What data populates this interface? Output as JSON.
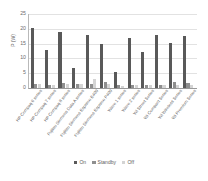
{
  "chart_data": {
    "type": "bar",
    "title": "",
    "xlabel": "",
    "ylabel": "P (W)",
    "ylim": [
      0,
      25
    ],
    "yticks": [
      0,
      5,
      10,
      15,
      20,
      25
    ],
    "grid": true,
    "legend_position": "bottom-center",
    "categories": [
      "HP Compaq 6 series",
      "HP Compaq 7 series",
      "HP Compaq 8 series",
      "Fujitsu Siemens Data A series",
      "Fujitsu Siemens Esprimo E400",
      "Fujitsu Siemens Esprimo P400",
      "Wave 1 series",
      "Wave 2 series",
      "Wi Street Series",
      "Wi Compact Series",
      "Wi Wireless Series",
      "Wi Premium Series"
    ],
    "series": [
      {
        "name": "On",
        "color": "#595959",
        "values": [
          20.2,
          12.8,
          18.8,
          6.8,
          17.8,
          14.8,
          5.4,
          16.9,
          12.3,
          17.9,
          15.2,
          17.6
        ]
      },
      {
        "name": "Standby",
        "color": "#8f8f8f",
        "values": [
          1.5,
          1.1,
          1.6,
          1.5,
          1.4,
          1.9,
          0.9,
          1.0,
          1.1,
          1.0,
          2.0,
          1.7
        ]
      },
      {
        "name": "Off",
        "color": "#d4d4d4",
        "values": [
          1.4,
          1.0,
          1.5,
          1.3,
          3.1,
          1.2,
          0.8,
          0.9,
          1.0,
          0.9,
          1.1,
          1.0
        ]
      }
    ]
  },
  "legend": {
    "items": [
      {
        "label": "On"
      },
      {
        "label": "Standby"
      },
      {
        "label": "Off"
      }
    ]
  }
}
